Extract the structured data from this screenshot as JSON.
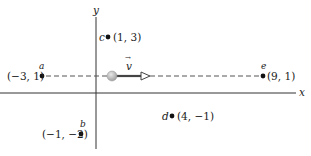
{
  "diagram": {
    "axes": {
      "x_label": "x",
      "y_label": "y"
    },
    "points": [
      {
        "name": "a",
        "coords": "(−3, 1)"
      },
      {
        "name": "b",
        "coords": "(−1, −2)"
      },
      {
        "name": "c",
        "coords": "(1, 3)"
      },
      {
        "name": "d",
        "coords": "(4, −1)"
      },
      {
        "name": "e",
        "coords": "(9, 1)"
      }
    ],
    "vector": {
      "label": "v",
      "arrow": "→"
    },
    "colors": {
      "axis": "#333333",
      "dashed": "#555555",
      "ball": "#b8b8b8",
      "arrow": "#444444"
    }
  }
}
